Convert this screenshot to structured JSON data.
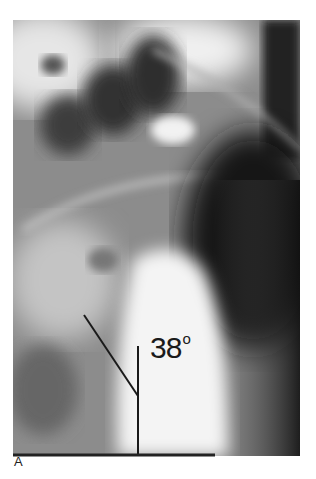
{
  "figure": {
    "label": "A",
    "type": "lateral radiograph",
    "annotation": {
      "angle_value": "38",
      "angle_unit": "o",
      "lines": [
        {
          "name": "diagonal-line",
          "x1": 84,
          "y1": 315,
          "x2": 138,
          "y2": 396
        },
        {
          "name": "vertical-line",
          "x1": 138,
          "y1": 346,
          "x2": 138,
          "y2": 455
        },
        {
          "name": "baseline",
          "x1": 13,
          "y1": 455,
          "x2": 215,
          "y2": 455
        }
      ]
    }
  }
}
